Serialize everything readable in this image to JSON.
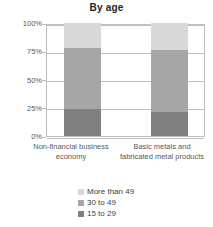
{
  "chart_data": {
    "type": "bar",
    "subtype": "stacked-100-percent",
    "title": "By age",
    "xlabel": "",
    "ylabel": "",
    "ylim": [
      0,
      100
    ],
    "yticks": [
      "0%",
      "25%",
      "50%",
      "75%",
      "100%"
    ],
    "ytick_values": [
      0,
      25,
      50,
      75,
      100
    ],
    "grid": true,
    "legend_position": "bottom",
    "categories": [
      "Non-financial business economy",
      "Basic metals and fabricated metal products"
    ],
    "series": [
      {
        "name": "More than 49",
        "color": "#d9d9d9",
        "values": [
          22,
          24
        ]
      },
      {
        "name": "30 to 49",
        "color": "#a6a6a6",
        "values": [
          54,
          55
        ]
      },
      {
        "name": "15 to 29",
        "color": "#808080",
        "values": [
          24,
          21
        ]
      }
    ],
    "stack_order_bottom_to_top": [
      "15 to 29",
      "30 to 49",
      "More than 49"
    ]
  },
  "colors": {
    "light_gray": "#d9d9d9",
    "medium_gray": "#a6a6a6",
    "dark_gray": "#808080",
    "axis": "#bfbfbf",
    "text": "#595959",
    "title_text": "#262626",
    "background": "#ffffff"
  }
}
